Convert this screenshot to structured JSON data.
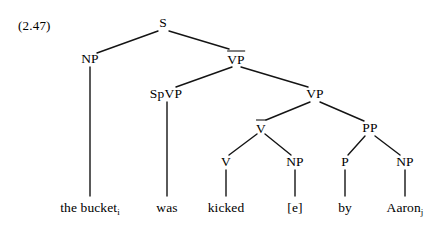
{
  "example": {
    "number_label": "(2.47)"
  },
  "tree": {
    "style": {
      "line_color": "#141414",
      "text_color": "#000000",
      "background": "#ffffff"
    },
    "nodes": [
      {
        "id": "S",
        "label": "S",
        "overbar": false,
        "x": 163,
        "y": 23
      },
      {
        "id": "NP1",
        "label": "NP",
        "overbar": false,
        "x": 90,
        "y": 59
      },
      {
        "id": "VPbar",
        "label": "VP",
        "overbar": true,
        "x": 236,
        "y": 58
      },
      {
        "id": "SpVP",
        "label": "SpVP",
        "overbar": false,
        "x": 166,
        "y": 94
      },
      {
        "id": "VP",
        "label": "VP",
        "overbar": false,
        "x": 315,
        "y": 94
      },
      {
        "id": "Vbar",
        "label": "V",
        "overbar": true,
        "x": 261,
        "y": 127
      },
      {
        "id": "PP",
        "label": "PP",
        "overbar": false,
        "x": 370,
        "y": 128
      },
      {
        "id": "V",
        "label": "V",
        "overbar": false,
        "x": 226,
        "y": 162
      },
      {
        "id": "NP2",
        "label": "NP",
        "overbar": false,
        "x": 295,
        "y": 162
      },
      {
        "id": "P",
        "label": "P",
        "overbar": false,
        "x": 345,
        "y": 162
      },
      {
        "id": "NP3",
        "label": "NP",
        "overbar": false,
        "x": 405,
        "y": 162
      }
    ],
    "edges": [
      {
        "from": "S",
        "to": "NP1",
        "x1": 158,
        "y1": 31,
        "x2": 97,
        "y2": 53
      },
      {
        "from": "S",
        "to": "VPbar",
        "x1": 169,
        "y1": 31,
        "x2": 229,
        "y2": 49
      },
      {
        "from": "VPbar",
        "to": "SpVP",
        "x1": 232,
        "y1": 67,
        "x2": 176,
        "y2": 87
      },
      {
        "from": "VPbar",
        "to": "VP",
        "x1": 241,
        "y1": 67,
        "x2": 308,
        "y2": 87
      },
      {
        "from": "VP",
        "to": "Vbar",
        "x1": 310,
        "y1": 102,
        "x2": 266,
        "y2": 120
      },
      {
        "from": "VP",
        "to": "PP",
        "x1": 320,
        "y1": 102,
        "x2": 364,
        "y2": 121
      },
      {
        "from": "Vbar",
        "to": "V",
        "x1": 257,
        "y1": 134,
        "x2": 229,
        "y2": 155
      },
      {
        "from": "Vbar",
        "to": "NP2",
        "x1": 265,
        "y1": 134,
        "x2": 291,
        "y2": 155
      },
      {
        "from": "PP",
        "to": "P",
        "x1": 365,
        "y1": 136,
        "x2": 348,
        "y2": 155
      },
      {
        "from": "PP",
        "to": "NP3",
        "x1": 375,
        "y1": 136,
        "x2": 400,
        "y2": 155
      },
      {
        "from": "NP1",
        "to": "leaf-the-bucket",
        "x1": 90,
        "y1": 67,
        "x2": 90,
        "y2": 196
      },
      {
        "from": "SpVP",
        "to": "leaf-was",
        "x1": 167,
        "y1": 102,
        "x2": 167,
        "y2": 196
      },
      {
        "from": "V",
        "to": "leaf-kicked",
        "x1": 226,
        "y1": 170,
        "x2": 226,
        "y2": 196
      },
      {
        "from": "NP2",
        "to": "leaf-e",
        "x1": 295,
        "y1": 170,
        "x2": 295,
        "y2": 196
      },
      {
        "from": "P",
        "to": "leaf-by",
        "x1": 345,
        "y1": 170,
        "x2": 345,
        "y2": 196
      },
      {
        "from": "NP3",
        "to": "leaf-aaron",
        "x1": 405,
        "y1": 170,
        "x2": 405,
        "y2": 196
      }
    ],
    "leaves": [
      {
        "id": "leaf-the-bucket",
        "text": "the bucket",
        "subscript": "i",
        "x": 90,
        "y": 208
      },
      {
        "id": "leaf-was",
        "text": "was",
        "subscript": "",
        "x": 167,
        "y": 208
      },
      {
        "id": "leaf-kicked",
        "text": "kicked",
        "subscript": "",
        "x": 226,
        "y": 208
      },
      {
        "id": "leaf-e",
        "text": "[e]",
        "subscript": "",
        "x": 295,
        "y": 208
      },
      {
        "id": "leaf-by",
        "text": "by",
        "subscript": "",
        "x": 345,
        "y": 208
      },
      {
        "id": "leaf-aaron",
        "text": "Aaron",
        "subscript": "j",
        "x": 405,
        "y": 208
      }
    ]
  }
}
